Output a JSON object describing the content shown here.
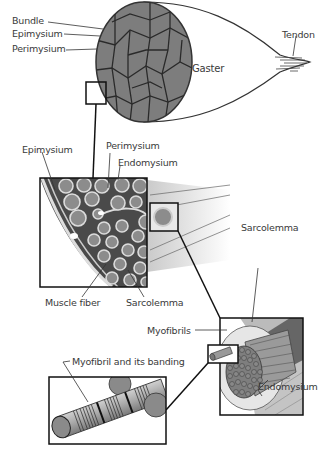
{
  "diagram": {
    "type": "anatomical-illustration",
    "colors": {
      "fiber_gray": "#8a8a8a",
      "outline": "#222222",
      "connective": "#e6e6e6",
      "label_text": "#3a3a3a"
    },
    "panels": [
      {
        "id": "gross-muscle",
        "labels": {
          "bundle": "Bundle",
          "epimysium": "Epimysium",
          "perimysium": "Perimysium",
          "gaster": "Gaster",
          "tendon": "Tendon"
        }
      },
      {
        "id": "cross-section",
        "labels": {
          "epimysium": "Epimysium",
          "perimysium": "Perimysium",
          "endomysium": "Endomysium",
          "muscle_fiber": "Muscle fiber",
          "sarcolemma": "Sarcolemma"
        }
      },
      {
        "id": "muscle-fiber",
        "labels": {
          "sarcolemma": "Sarcolemma",
          "myofibrils": "Myofibrils",
          "endomysium": "Endomysium"
        }
      },
      {
        "id": "myofibril",
        "labels": {
          "myofibril_banding": "Myofibril and its banding"
        }
      }
    ]
  }
}
